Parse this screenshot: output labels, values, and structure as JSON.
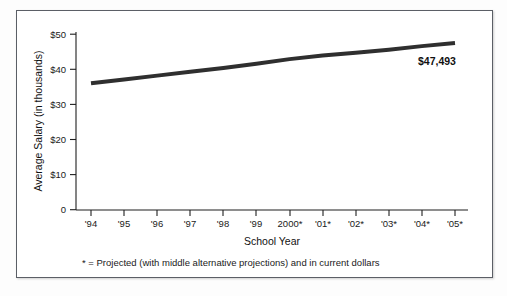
{
  "chart_data": {
    "type": "line",
    "title": "",
    "subtitle": "",
    "xlabel": "School Year",
    "ylabel": "Average Salary (in thousands)",
    "categories": [
      "'94",
      "'95",
      "'96",
      "'97",
      "'98",
      "'99",
      "2000*",
      "'01*",
      "'02*",
      "'03*",
      "'04*",
      "'05*"
    ],
    "values": [
      36.0,
      37.1,
      38.2,
      39.3,
      40.4,
      41.6,
      42.9,
      43.9,
      44.7,
      45.6,
      46.6,
      47.5
    ],
    "series": [
      {
        "name": "Average Salary",
        "values": [
          36.0,
          37.1,
          38.2,
          39.3,
          40.4,
          41.6,
          42.9,
          43.9,
          44.7,
          45.6,
          46.6,
          47.5
        ]
      }
    ],
    "ylim": [
      0,
      50
    ],
    "y_ticks": [
      0,
      10,
      20,
      30,
      40,
      50
    ],
    "y_tick_labels": [
      "0",
      "$10",
      "$20",
      "$30",
      "$40",
      "$50"
    ],
    "x_tick_labels": [
      "'94",
      "'95",
      "'96",
      "'97",
      "'98",
      "'99",
      "2000*",
      "'01*",
      "'02*",
      "'03*",
      "'04*",
      "'05*"
    ],
    "grid": false,
    "legend": false,
    "legend_position": "none",
    "annotations": [
      {
        "text": "$47,493",
        "x_category": "'05*",
        "value": 47.493
      }
    ],
    "line_color": "#2f2f2f",
    "line_width": 4
  },
  "footnote": {
    "text": "* = Projected (with middle alternative projections) and in current dollars"
  },
  "axis": {
    "y_title": "Average Salary (in thousands)",
    "x_title": "School Year",
    "y_labels": [
      "$50",
      "$40",
      "$30",
      "$20",
      "$10",
      "0"
    ],
    "x_labels": [
      "'94",
      "'95",
      "'96",
      "'97",
      "'98",
      "'99",
      "2000*",
      "'01*",
      "'02*",
      "'03*",
      "'04*",
      "'05*"
    ]
  },
  "colors": {
    "line": "#2f2f2f",
    "axis": "#1f1f1f",
    "text": "#111111",
    "frame": "#5b5f66",
    "background": "#ffffff"
  },
  "value_callout": "$47,493"
}
